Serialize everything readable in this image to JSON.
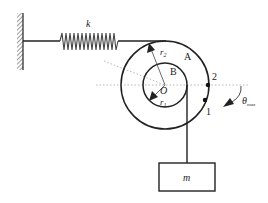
{
  "diagram": {
    "type": "mechanics-pulley-spring-system",
    "labels": {
      "spring": "k",
      "outer_radius": "r",
      "outer_radius_sub": "2",
      "inner_radius": "r",
      "inner_radius_sub": "1",
      "outer_disk": "A",
      "inner_disk": "B",
      "center": "O",
      "point_2": "2",
      "point_1": "1",
      "angle": "θ",
      "angle_sub": "max",
      "mass": "m"
    },
    "colors": {
      "stroke": "#222222",
      "dotted": "#999999",
      "background": "#ffffff"
    }
  }
}
